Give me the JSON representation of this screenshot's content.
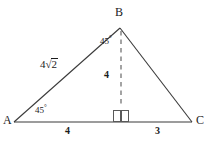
{
  "figure": {
    "background_color": "#ffffff",
    "stroke_color": "#3a3a3a",
    "text_color": "#1b1b1b"
  },
  "vertices": {
    "a": {
      "label": "A",
      "x": 14,
      "y": 122
    },
    "b": {
      "label": "B",
      "x": 120,
      "y": 28
    },
    "c": {
      "label": "C",
      "x": 192,
      "y": 122
    },
    "foot": {
      "label": "",
      "x": 121,
      "y": 122
    }
  },
  "angles": {
    "at_a": {
      "value": "45",
      "unit": "°"
    },
    "at_b": {
      "value": "45",
      "unit": "°"
    },
    "right_angle_marker": "square"
  },
  "sides": {
    "ab": {
      "coefficient": "4",
      "radical_sign": "√",
      "radicand": "2",
      "full": "4√2"
    },
    "altitude": {
      "label": "4",
      "style": "dashed"
    },
    "base_left": {
      "label": "4"
    },
    "base_right": {
      "label": "3"
    }
  }
}
